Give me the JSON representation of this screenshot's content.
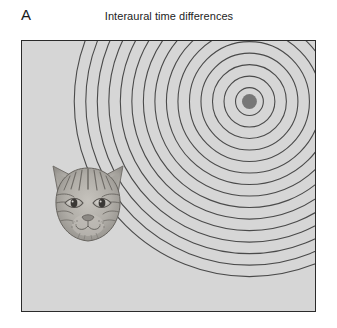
{
  "figure": {
    "panel_label": "A",
    "title": "Interaural time differences",
    "background_color": "#ffffff",
    "panel_fill_color": "#d6d6d6",
    "panel_border_color": "#2b2b2b",
    "wave_line_color": "#4a4a4a",
    "source_dot_color": "#777777",
    "cat_outline_color": "#5b5b5b"
  },
  "scene": {
    "sound_source": {
      "label": "sound-source",
      "center_x": 229,
      "center_y": 61,
      "radius": 7.5
    },
    "sound_waves": {
      "label": "concentric-sound-wavefronts",
      "ring_count": 15,
      "first_ring_radius": 14,
      "ring_spacing": 11.6,
      "stroke_width": 1.1
    },
    "listener": {
      "label": "cat-head",
      "species": "cat",
      "x": 24,
      "y": 118,
      "width": 84,
      "height": 94
    }
  },
  "chart_data": {
    "type": "scatter",
    "title": "Interaural time differences",
    "xlabel": "",
    "ylabel": "",
    "annotations": [
      "A",
      "Interaural time differences"
    ],
    "series": [
      {
        "name": "sound source",
        "x": [
          229
        ],
        "y": [
          61
        ]
      },
      {
        "name": "listener (cat head)",
        "x": [
          66
        ],
        "y": [
          165
        ]
      }
    ],
    "rings": {
      "name": "wavefront radii (px)",
      "values": [
        14,
        25.6,
        37.2,
        48.8,
        60.4,
        72,
        83.6,
        95.2,
        106.8,
        118.4,
        130,
        141.6,
        153.2,
        164.8,
        176.4
      ]
    },
    "xlim": [
      0,
      295
    ],
    "ylim": [
      0,
      272
    ],
    "grid": false,
    "legend": "none"
  }
}
